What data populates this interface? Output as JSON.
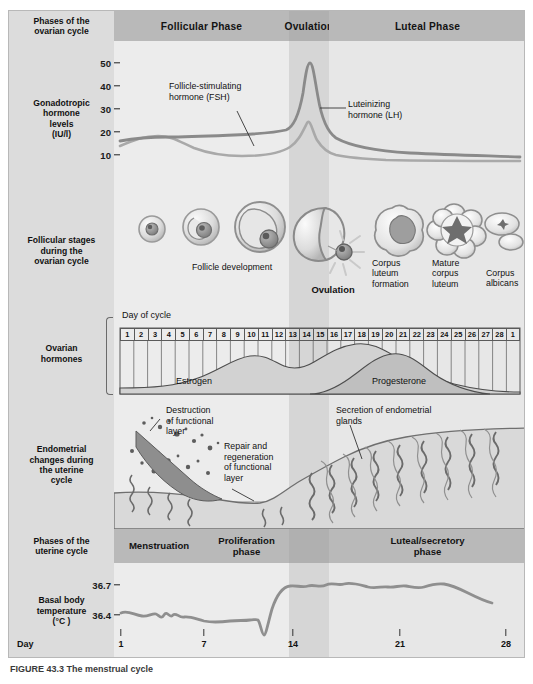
{
  "figure": {
    "caption": "FIGURE 43.3   The menstrual cycle"
  },
  "rows": {
    "phases_ovarian": {
      "label": "Phases of the\novarian cycle",
      "bands": [
        {
          "name": "follicular",
          "label": "Follicular Phase"
        },
        {
          "name": "ovulation",
          "label": "Ovulation"
        },
        {
          "name": "luteal",
          "label": "Luteal Phase"
        }
      ]
    },
    "gonadotropic": {
      "label": "Gonadotropic\nhormone\nlevels\n(IU/l)",
      "yticks": [
        "50",
        "40",
        "30",
        "20",
        "10"
      ],
      "annotations": [
        {
          "name": "fsh",
          "text": "Follicle-stimulating\nhormone (FSH)"
        },
        {
          "name": "lh",
          "text": "Luteinizing\nhormone (LH)"
        }
      ]
    },
    "follicular_stages": {
      "label": "Follicular stages\nduring the\novarian cycle",
      "labels": [
        {
          "name": "follicle-development",
          "text": "Follicle development"
        },
        {
          "name": "ovulation",
          "text": "Ovulation"
        },
        {
          "name": "corpus-luteum-formation",
          "text": "Corpus\nluteum\nformation"
        },
        {
          "name": "mature-corpus-luteum",
          "text": "Mature\ncorpus\nluteum"
        },
        {
          "name": "corpus-albicans",
          "text": "Corpus\nalbicans"
        }
      ]
    },
    "ovarian_hormones": {
      "label": "Ovarian\nhormones",
      "day_of_cycle_title": "Day of cycle",
      "days": [
        "1",
        "2",
        "3",
        "4",
        "5",
        "6",
        "7",
        "8",
        "9",
        "10",
        "11",
        "12",
        "13",
        "14",
        "15",
        "16",
        "17",
        "18",
        "19",
        "20",
        "21",
        "22",
        "23",
        "24",
        "25",
        "26",
        "27",
        "28",
        "1"
      ],
      "curves": [
        {
          "name": "estrogen",
          "label": "Estrogen"
        },
        {
          "name": "progesterone",
          "label": "Progesterone"
        }
      ]
    },
    "endometrial": {
      "label": "Endometrial\nchanges during\nthe uterine\ncycle",
      "annotations": [
        {
          "name": "destruction",
          "text": "Destruction\nof functional\nlayer"
        },
        {
          "name": "repair",
          "text": "Repair and\nregeneration\nof functional\nlayer"
        },
        {
          "name": "secretion",
          "text": "Secretion of endometrial\nglands"
        }
      ]
    },
    "phases_uterine": {
      "label": "Phases of the\nuterine cycle",
      "bands": [
        {
          "name": "menstruation",
          "label": "Menstruation"
        },
        {
          "name": "proliferation",
          "label": "Proliferation\nphase"
        },
        {
          "name": "ovulation",
          "label": ""
        },
        {
          "name": "luteal-secretory",
          "label": "Luteal/secretory\nphase"
        }
      ]
    },
    "bbt": {
      "label": "Basal body\ntemperature\n(°C )",
      "yticks": [
        "36.7",
        "36.4"
      ],
      "axis_label": "Day",
      "xticks": [
        "1",
        "7",
        "14",
        "21",
        "28"
      ]
    }
  },
  "chart_data": [
    {
      "type": "line",
      "name": "gonadotropic-hormones",
      "title": "Gonadotropic hormone levels",
      "ylabel": "Gonadotropic hormone levels (IU/l)",
      "xlabel": "Day of cycle",
      "ylim": [
        5,
        55
      ],
      "yticks": [
        10,
        20,
        30,
        40,
        50
      ],
      "xlim": [
        1,
        29
      ],
      "grid": false,
      "legend": [
        "Follicle-stimulating hormone (FSH)",
        "Luteinizing hormone (LH)"
      ],
      "x": [
        1,
        2,
        3,
        4,
        5,
        6,
        7,
        8,
        9,
        10,
        11,
        12,
        13,
        13.5,
        14,
        14.5,
        15,
        16,
        17,
        18,
        19,
        20,
        21,
        22,
        23,
        24,
        25,
        26,
        27,
        28,
        29
      ],
      "series": [
        {
          "name": "Luteinizing hormone (LH)",
          "color": "#8a8a8a",
          "values": [
            14.5,
            15,
            15.3,
            15.2,
            15,
            14.8,
            14.8,
            15,
            15.2,
            15.5,
            16,
            17,
            21,
            34,
            50,
            42,
            27,
            19,
            16,
            15,
            14.5,
            14,
            13.5,
            13.2,
            13,
            12.8,
            12.5,
            12.3,
            12.2,
            12,
            12
          ]
        },
        {
          "name": "Follicle-stimulating hormone (FSH)",
          "color": "#a8a8a8",
          "values": [
            12.5,
            13.5,
            14.3,
            14.6,
            14.6,
            14.2,
            13.6,
            13,
            12.4,
            11.8,
            11.4,
            11.2,
            11.8,
            14,
            21,
            18,
            14,
            12.5,
            12,
            11.8,
            11.6,
            11.5,
            11.4,
            11.3,
            11.2,
            11.1,
            11,
            11,
            11,
            11,
            11
          ]
        }
      ]
    },
    {
      "type": "area",
      "name": "ovarian-hormones",
      "title": "Ovarian hormones",
      "xlabel": "Day of cycle",
      "grid": true,
      "categories": [
        "1",
        "2",
        "3",
        "4",
        "5",
        "6",
        "7",
        "8",
        "9",
        "10",
        "11",
        "12",
        "13",
        "14",
        "15",
        "16",
        "17",
        "18",
        "19",
        "20",
        "21",
        "22",
        "23",
        "24",
        "25",
        "26",
        "27",
        "28",
        "1"
      ],
      "series": [
        {
          "name": "Estrogen",
          "color": "#cfcfcf",
          "values": [
            8,
            8,
            8,
            8,
            9,
            10,
            12,
            16,
            22,
            30,
            38,
            45,
            43,
            36,
            32,
            34,
            40,
            48,
            54,
            57,
            56,
            52,
            46,
            38,
            28,
            18,
            12,
            9,
            8
          ]
        },
        {
          "name": "Progesterone",
          "color": "#bdbdbd",
          "values": [
            0,
            0,
            0,
            0,
            0,
            0,
            0,
            0,
            0,
            0,
            0,
            0,
            2,
            5,
            12,
            22,
            34,
            48,
            60,
            68,
            70,
            66,
            58,
            46,
            32,
            18,
            8,
            2,
            0
          ]
        }
      ]
    },
    {
      "type": "line",
      "name": "basal-body-temperature",
      "title": "Basal body temperature",
      "ylabel": "Basal body temperature (°C)",
      "xlabel": "Day",
      "yticks": [
        36.4,
        36.7
      ],
      "ylim": [
        36.25,
        36.85
      ],
      "xlim": [
        1,
        28
      ],
      "xticks": [
        1,
        7,
        14,
        21,
        28
      ],
      "grid": false,
      "x": [
        1,
        2,
        3,
        4,
        5,
        6,
        7,
        8,
        9,
        10,
        11,
        12,
        13,
        13.5,
        14,
        14.5,
        15,
        16,
        17,
        18,
        19,
        20,
        21,
        22,
        23,
        24,
        25,
        26,
        27,
        28
      ],
      "series": [
        {
          "name": "Basal body temperature",
          "color": "#8f8f8f",
          "values": [
            36.44,
            36.42,
            36.41,
            36.43,
            36.42,
            36.44,
            36.43,
            36.41,
            36.4,
            36.39,
            36.4,
            36.4,
            36.4,
            36.38,
            36.3,
            36.52,
            36.68,
            36.7,
            36.69,
            36.71,
            36.7,
            36.7,
            36.69,
            36.68,
            36.69,
            36.68,
            36.7,
            36.68,
            36.63,
            36.58
          ]
        }
      ]
    }
  ]
}
